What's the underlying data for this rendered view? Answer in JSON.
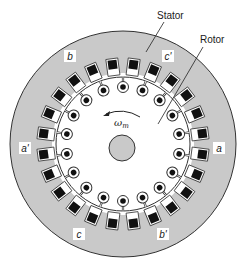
{
  "diagram": {
    "title_labels": {
      "stator": "Stator",
      "rotor": "Rotor"
    },
    "phase_labels": [
      {
        "id": "b",
        "text": "b",
        "x": 70,
        "y": 58
      },
      {
        "id": "c'",
        "text": "c'",
        "x": 168,
        "y": 58
      },
      {
        "id": "a'",
        "text": "a'",
        "x": 25,
        "y": 150
      },
      {
        "id": "a",
        "text": "a",
        "x": 219,
        "y": 150
      },
      {
        "id": "c",
        "text": "c",
        "x": 79,
        "y": 236
      },
      {
        "id": "b'",
        "text": "b'",
        "x": 163,
        "y": 236
      }
    ],
    "rotation": {
      "symbol": "ω",
      "subscript": "m",
      "direction": "counter-clockwise"
    },
    "geometry": {
      "center": [
        123,
        144
      ],
      "stator_outer_radius": 113,
      "stator_bore_radius": 71,
      "rotor_radius": 67,
      "shaft_center": [
        122,
        148
      ],
      "shaft_radius": 13,
      "stator_slot_count": 24,
      "rotor_bar_count": 18
    },
    "colors": {
      "stator_fill": "#c9c9c9",
      "rotor_fill": "#ffffff",
      "slot_fill": "#111111",
      "outline": "#333333",
      "shaft_fill": "#c9c9c9"
    }
  }
}
